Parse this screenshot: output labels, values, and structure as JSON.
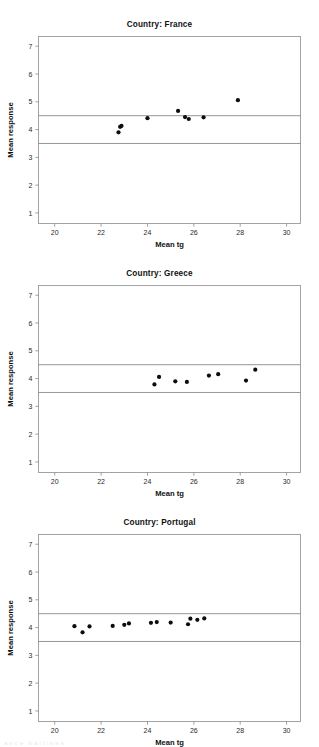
{
  "figure": {
    "panel_count": 3,
    "background_color": "#ffffff",
    "dot_color": "#0d0d0d",
    "frame_color": "#9a9a9a",
    "reference_line_color": "#7c7c7c",
    "footer_artifact": "ance  barlines"
  },
  "chart_data": [
    {
      "type": "scatter",
      "title": "Country: France",
      "xlabel": "Mean tg",
      "ylabel": "Mean response",
      "xlim": [
        19.3,
        30.6
      ],
      "ylim": [
        0.62,
        7.35
      ],
      "xticks": [
        20,
        22,
        24,
        26,
        28,
        30
      ],
      "yticks": [
        1,
        2,
        3,
        4,
        5,
        6,
        7
      ],
      "grid": false,
      "legend": "none",
      "reference_lines": [
        {
          "axis": "y",
          "value": 4.5
        },
        {
          "axis": "y",
          "value": 3.5
        }
      ],
      "x": [
        22.75,
        22.82,
        22.88,
        24.0,
        25.32,
        25.62,
        25.78,
        26.42,
        27.9
      ],
      "y": [
        3.9,
        4.1,
        4.13,
        4.41,
        4.67,
        4.45,
        4.38,
        4.44,
        5.06
      ]
    },
    {
      "type": "scatter",
      "title": "Country: Greece",
      "xlabel": "Mean tg",
      "ylabel": "Mean response",
      "xlim": [
        19.3,
        30.6
      ],
      "ylim": [
        0.62,
        7.35
      ],
      "xticks": [
        20,
        22,
        24,
        26,
        28,
        30
      ],
      "yticks": [
        1,
        2,
        3,
        4,
        5,
        6,
        7
      ],
      "grid": false,
      "legend": "none",
      "reference_lines": [
        {
          "axis": "y",
          "value": 4.5
        },
        {
          "axis": "y",
          "value": 3.5
        }
      ],
      "x": [
        24.3,
        24.5,
        25.2,
        25.7,
        26.65,
        27.05,
        28.25,
        28.65
      ],
      "y": [
        3.79,
        4.06,
        3.9,
        3.88,
        4.11,
        4.16,
        3.93,
        4.32
      ]
    },
    {
      "type": "scatter",
      "title": "Country: Portugal",
      "xlabel": "Mean tg",
      "ylabel": "Mean response",
      "xlim": [
        19.3,
        30.6
      ],
      "ylim": [
        0.62,
        7.35
      ],
      "xticks": [
        20,
        22,
        24,
        26,
        28,
        30
      ],
      "yticks": [
        1,
        2,
        3,
        4,
        5,
        6,
        7
      ],
      "grid": false,
      "legend": "none",
      "reference_lines": [
        {
          "axis": "y",
          "value": 4.5
        },
        {
          "axis": "y",
          "value": 3.5
        }
      ],
      "x": [
        20.85,
        21.2,
        21.5,
        22.5,
        23.0,
        23.2,
        24.15,
        24.4,
        25.0,
        25.75,
        25.85,
        26.15,
        26.45
      ],
      "y": [
        4.05,
        3.83,
        4.04,
        4.06,
        4.1,
        4.15,
        4.17,
        4.2,
        4.18,
        4.12,
        4.32,
        4.28,
        4.33
      ]
    }
  ]
}
